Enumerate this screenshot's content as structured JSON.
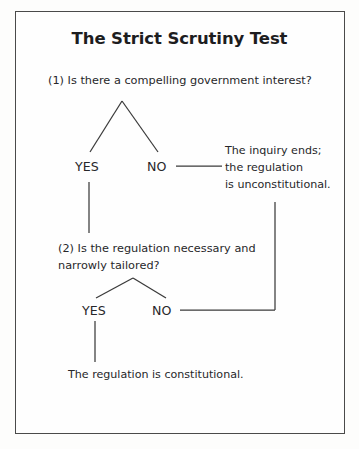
{
  "diagram": {
    "title": "The Strict Scrutiny Test",
    "type": "decision-flowchart",
    "frame": {
      "border_color": "#4a4a4a"
    },
    "line_color": "#3a3a3a",
    "steps": [
      {
        "id": "question-1",
        "number": "(1)",
        "text": "(1) Is there a compelling government interest?",
        "branches": [
          {
            "label": "YES",
            "leads_to": "question-2"
          },
          {
            "label": "NO",
            "leads_to": "outcome-unconstitutional"
          }
        ]
      },
      {
        "id": "question-2",
        "number": "(2)",
        "line1": "(2) Is the regulation necessary and",
        "line2": "narrowly tailored?",
        "branches": [
          {
            "label": "YES",
            "leads_to": "outcome-constitutional"
          },
          {
            "label": "NO",
            "leads_to": "outcome-unconstitutional"
          }
        ]
      }
    ],
    "outcomes": [
      {
        "id": "outcome-unconstitutional",
        "line1": "The inquiry ends;",
        "line2": "the regulation",
        "line3": "is unconstitutional."
      },
      {
        "id": "outcome-constitutional",
        "text": "The regulation is constitutional."
      }
    ],
    "labels": {
      "yes": "YES",
      "no": "NO"
    }
  }
}
